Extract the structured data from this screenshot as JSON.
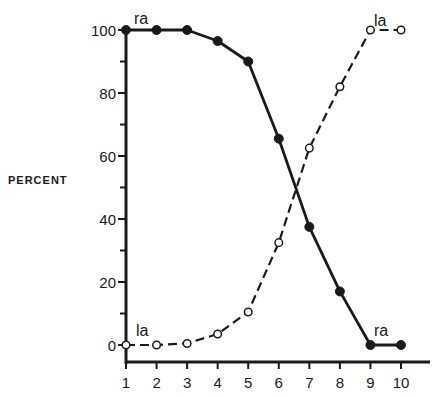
{
  "chart_data": {
    "type": "line",
    "title": "",
    "xlabel": "",
    "ylabel": "PERCENT",
    "x": [
      1,
      2,
      3,
      4,
      5,
      6,
      7,
      8,
      9,
      10
    ],
    "xlim": [
      1,
      10
    ],
    "ylim": [
      0,
      100
    ],
    "x_ticks": [
      "1",
      "2",
      "3",
      "4",
      "5",
      "6",
      "7",
      "8",
      "9",
      "10"
    ],
    "y_ticks": [
      "0",
      "20",
      "40",
      "60",
      "80",
      "100"
    ],
    "y_minor_ticks": [
      10,
      30,
      50,
      70,
      90
    ],
    "grid": false,
    "legend": "none (inline labels)",
    "series": [
      {
        "name": "ra",
        "style": "solid line, filled circle markers",
        "values": [
          100,
          100,
          100,
          96.5,
          90,
          65.5,
          37.5,
          17,
          0,
          0
        ]
      },
      {
        "name": "la",
        "style": "dashed line, open circle markers",
        "values": [
          0,
          0,
          0.5,
          3.5,
          10.5,
          32.5,
          62.5,
          82,
          100,
          100
        ]
      }
    ],
    "annotations": [
      {
        "text": "ra",
        "near": [
          1,
          100
        ]
      },
      {
        "text": "la",
        "near": [
          9,
          100
        ]
      },
      {
        "text": "la",
        "near": [
          1,
          0
        ]
      },
      {
        "text": "ra",
        "near": [
          9,
          0
        ]
      }
    ]
  },
  "colors": {
    "ink": "#1a1a1a",
    "background": "#ffffff"
  }
}
